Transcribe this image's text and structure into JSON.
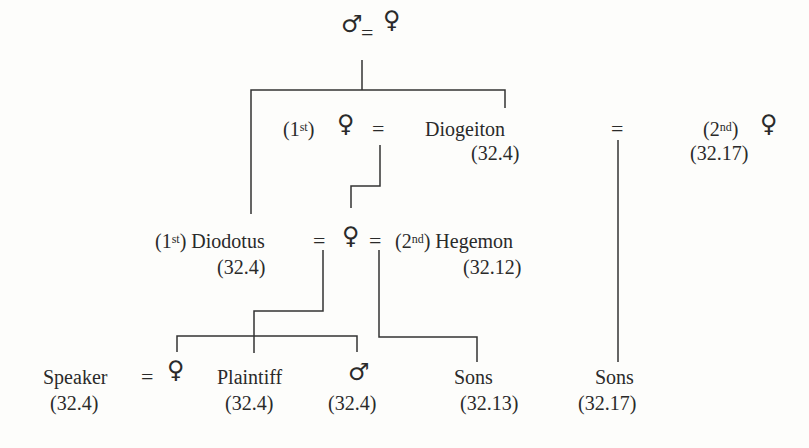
{
  "diagram": {
    "type": "family-tree",
    "symbols": {
      "male": "♂",
      "female": "♀",
      "marriage": "="
    },
    "root": {
      "male": "♂",
      "eq": "=",
      "female": "♀"
    },
    "gen1": {
      "first_wife": {
        "ord_num": "1",
        "ord_sup": "st",
        "symbol": "♀"
      },
      "eq_left": "=",
      "diogeiton": {
        "name": "Diogeiton",
        "ref": "(32.4)"
      },
      "eq_right": "=",
      "second_wife": {
        "ord_num": "2",
        "ord_sup": "nd",
        "symbol": "♀",
        "ref": "(32.17)"
      }
    },
    "gen2": {
      "diodotus": {
        "ord_num": "1",
        "ord_sup": "st",
        "name": "Diodotus",
        "ref": "(32.4)"
      },
      "eq_left": "=",
      "daughter": {
        "symbol": "♀"
      },
      "eq_right": "=",
      "hegemon": {
        "ord_num": "2",
        "ord_sup": "nd",
        "name": "Hegemon",
        "ref": "(32.12)"
      }
    },
    "gen3": {
      "speaker": {
        "name": "Speaker",
        "ref": "(32.4)"
      },
      "eq": "=",
      "speaker_wife": {
        "symbol": "♀"
      },
      "plaintiff": {
        "name": "Plaintiff",
        "ref": "(32.4)"
      },
      "son": {
        "symbol": "♂",
        "ref": "(32.4)"
      },
      "hegemon_sons": {
        "name": "Sons",
        "ref": "(32.13)"
      },
      "diogeiton_sons": {
        "name": "Sons",
        "ref": "(32.17)"
      }
    }
  }
}
